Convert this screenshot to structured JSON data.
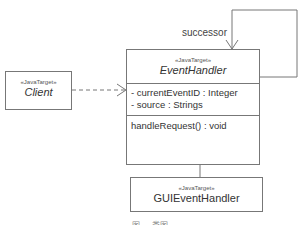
{
  "diagram": {
    "type": "uml-class-diagram",
    "classes": {
      "client": {
        "stereotype": "«JavaTarget»",
        "name": "Client",
        "italic": true
      },
      "event_handler": {
        "stereotype": "«JavaTarget»",
        "name": "EventHandler",
        "italic": true,
        "attributes": [
          "- currentEventID : Integer",
          "- source : Strings"
        ],
        "operations": [
          "handleRequest() : void"
        ]
      },
      "gui_event_handler": {
        "stereotype": "«JavaTarget»",
        "name": "GUIEventHandler",
        "italic": false
      }
    },
    "relations": [
      {
        "type": "dependency",
        "from": "Client",
        "to": "EventHandler",
        "style": "dashed-open-arrow"
      },
      {
        "type": "association",
        "from": "EventHandler",
        "to": "EventHandler",
        "label": "successor",
        "style": "self-loop-open-arrow"
      },
      {
        "type": "generalization",
        "from": "GUIEventHandler",
        "to": "EventHandler",
        "style": "hollow-triangle"
      }
    ],
    "self_loop_label": "successor",
    "caption": "图 … 类图"
  },
  "colors": {
    "line": "#777777",
    "text": "#333333",
    "background": "#ffffff"
  }
}
